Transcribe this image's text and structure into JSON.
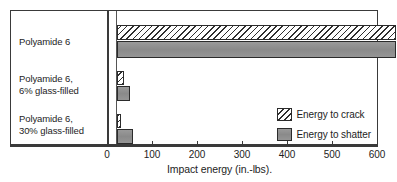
{
  "chart_data": {
    "type": "bar",
    "orientation": "horizontal",
    "title": "",
    "xlabel": "Impact energy (in.-lbs).",
    "ylabel": "",
    "xlim": [
      0,
      600
    ],
    "xticks": [
      0,
      100,
      200,
      300,
      400,
      500,
      600
    ],
    "xtick_labels": [
      "0",
      "100",
      "200",
      "300",
      "400",
      "500",
      "600"
    ],
    "grid": false,
    "legend_position": "inside-lower-right",
    "categories": [
      "Polyamide 6",
      "Polyamide 6, 6% glass-filled",
      "Polyamide 6, 30% glass-filled"
    ],
    "category_lines": [
      [
        "Polyamide 6",
        ""
      ],
      [
        "Polyamide 6,",
        "6% glass-filled"
      ],
      [
        "Polyamide 6,",
        "30% glass-filled"
      ]
    ],
    "series": [
      {
        "name": "Energy to crack",
        "pattern": "diagonal-hatch",
        "values": [
          620,
          15,
          8
        ],
        "notes": [
          "exceeds axis maximum of 600",
          "",
          ""
        ]
      },
      {
        "name": "Energy to shatter",
        "pattern": "solid-gray",
        "color": "#8f8f8f",
        "values": [
          620,
          28,
          35
        ],
        "notes": [
          "exceeds axis maximum of 600",
          "",
          ""
        ]
      }
    ]
  },
  "legend": {
    "items": [
      {
        "label": "Energy to crack",
        "swatch": "hatch-swatch"
      },
      {
        "label": "Energy to shatter",
        "swatch": "gray-swatch"
      }
    ]
  },
  "axis": {
    "title": "Impact energy (in.-lbs).",
    "ticks": [
      "0",
      "100",
      "200",
      "300",
      "400",
      "500",
      "600"
    ]
  },
  "categories": {
    "items": [
      {
        "line1": "Polyamide 6",
        "line2": ""
      },
      {
        "line1": "Polyamide 6,",
        "line2": "6% glass-filled"
      },
      {
        "line1": "Polyamide 6,",
        "line2": "30% glass-filled"
      }
    ]
  },
  "caption_remnant": ""
}
